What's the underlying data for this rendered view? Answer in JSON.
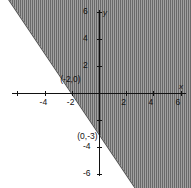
{
  "chart_data": {
    "type": "line",
    "title": "",
    "xlabel": "x",
    "ylabel": "y",
    "xlim": [
      -6.5,
      6.5
    ],
    "ylim": [
      -6.8,
      6.8
    ],
    "grid": false,
    "legend": "none",
    "x_ticks": [
      -6,
      -4,
      -2,
      2,
      4,
      6
    ],
    "x_tick_labels": [
      "",
      "-4",
      "-2",
      "2",
      "4",
      "6"
    ],
    "y_ticks": [
      -6,
      -4,
      -2,
      2,
      4,
      6
    ],
    "y_tick_labels": [
      "-6",
      "-4",
      "",
      "2",
      "4",
      "6"
    ],
    "boundary_line": {
      "equation": "y = -3/2 x - 3",
      "slope": -1.5,
      "intercept": -3,
      "style": "solid",
      "points": [
        [
          -2,
          0
        ],
        [
          0,
          -3
        ]
      ]
    },
    "shaded_region": {
      "side": "above",
      "inequality": "y >= -3/2 x - 3",
      "fill": "#8d8d8d",
      "pattern": "vertical-hatch"
    },
    "annotations": [
      {
        "text": "(-2,0)",
        "x": -2.85,
        "y": 0.95
      },
      {
        "text": "(0,-3)",
        "x": -1.6,
        "y": -3.25
      }
    ]
  },
  "axis": {
    "x_name": "x",
    "y_name": "y"
  },
  "ticks": {
    "x": [
      {
        "label": "",
        "x": -6
      },
      {
        "label": "-4",
        "x": -4
      },
      {
        "label": "-2",
        "x": -2
      },
      {
        "label": "2",
        "x": 2
      },
      {
        "label": "4",
        "x": 4
      },
      {
        "label": "6",
        "x": 6
      }
    ],
    "y": [
      {
        "label": "6",
        "y": 6
      },
      {
        "label": "4",
        "y": 4
      },
      {
        "label": "2",
        "y": 2
      },
      {
        "label": "",
        "y": -2
      },
      {
        "label": "-4",
        "y": -4
      },
      {
        "label": "-6",
        "y": -6
      }
    ]
  },
  "points": [
    {
      "label": "(-2,0)"
    },
    {
      "label": "(0,-3)"
    }
  ]
}
